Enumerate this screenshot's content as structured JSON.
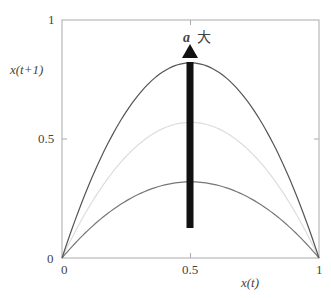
{
  "chart_data": {
    "type": "line",
    "title": "",
    "xlabel": "x(t)",
    "ylabel": "x(t+1)",
    "xlim": [
      0,
      1
    ],
    "ylim": [
      0,
      1
    ],
    "x_ticks": [
      "0",
      "0.5",
      "1"
    ],
    "y_ticks": [
      "0",
      "0.5",
      "1"
    ],
    "grid": false,
    "series": [
      {
        "name": "high a",
        "peak": 0.82,
        "color": "#555555",
        "formula": "4*0.82*x*(1-x)"
      },
      {
        "name": "mid a",
        "peak": 0.57,
        "color": "#dddddd",
        "formula": "4*0.57*x*(1-x)"
      },
      {
        "name": "low a",
        "peak": 0.32,
        "color": "#777777",
        "formula": "4*0.32*x*(1-x)"
      }
    ],
    "annotation": {
      "text_var": "a",
      "text_suffix": "大",
      "arrow": "upward at x=0.5 from y≈0.13 to y≈0.87"
    }
  },
  "labels": {
    "y_axis": "x(t+1)",
    "x_axis": "x(t)",
    "y_tick_1": "1",
    "y_tick_05": "0.5",
    "y_tick_0": "0",
    "x_tick_0": "0",
    "x_tick_05": "0.5",
    "x_tick_1": "1",
    "arrow_var": "a",
    "arrow_text": "大"
  }
}
